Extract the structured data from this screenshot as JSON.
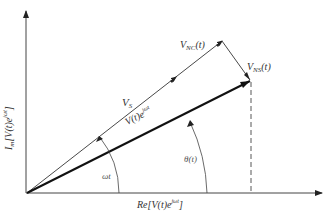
{
  "diagram": {
    "type": "phasor-diagram",
    "axes": {
      "x_label": "Re[V(t)e^{jωt}]",
      "y_label": "Im[V(t)e^{jωt}]"
    },
    "vectors": [
      {
        "name": "V_S",
        "label": "V_S",
        "from": "origin",
        "to": "tip of V_NC"
      },
      {
        "name": "V_NC(t)",
        "label": "V_NC(t)",
        "direction": "along V_S"
      },
      {
        "name": "V_NS(t)",
        "label": "V_NS(t)",
        "from": "tip of V_S",
        "to": "tip of V(t)e^{jωt}"
      },
      {
        "name": "V(t)e^{jωt}",
        "label": "V(t)e^{jωt}",
        "from": "origin",
        "style": "bold"
      }
    ],
    "angles": [
      {
        "label": "ωt",
        "between": [
          "Re axis",
          "V_S"
        ]
      },
      {
        "label": "θ(t)",
        "between": [
          "Re axis",
          "V(t)e^{jωt}"
        ]
      }
    ],
    "projection": {
      "style": "dashed",
      "from": "tip of V(t)e^{jωt}",
      "to": "Re axis"
    }
  },
  "labels": {
    "vs_main": "V",
    "vs_sub": "S",
    "vnc_main": "V",
    "vnc_sub": "NC",
    "vnc_tail": "(t)",
    "vns_main": "V",
    "vns_sub": "NS",
    "vns_tail": "(t)",
    "vt_main": "V(t)e",
    "vt_sup": "jωt",
    "omega_t": "ωt",
    "theta_t": "θ(t)",
    "x_axis_main": "Re[V(t)e",
    "x_axis_sup": "jωt",
    "x_axis_tail": "]",
    "y_axis_main": "I",
    "y_axis_sub": "m",
    "y_axis_rest": "[V(t)e",
    "y_axis_sup": "jωt",
    "y_axis_tail": "]"
  }
}
